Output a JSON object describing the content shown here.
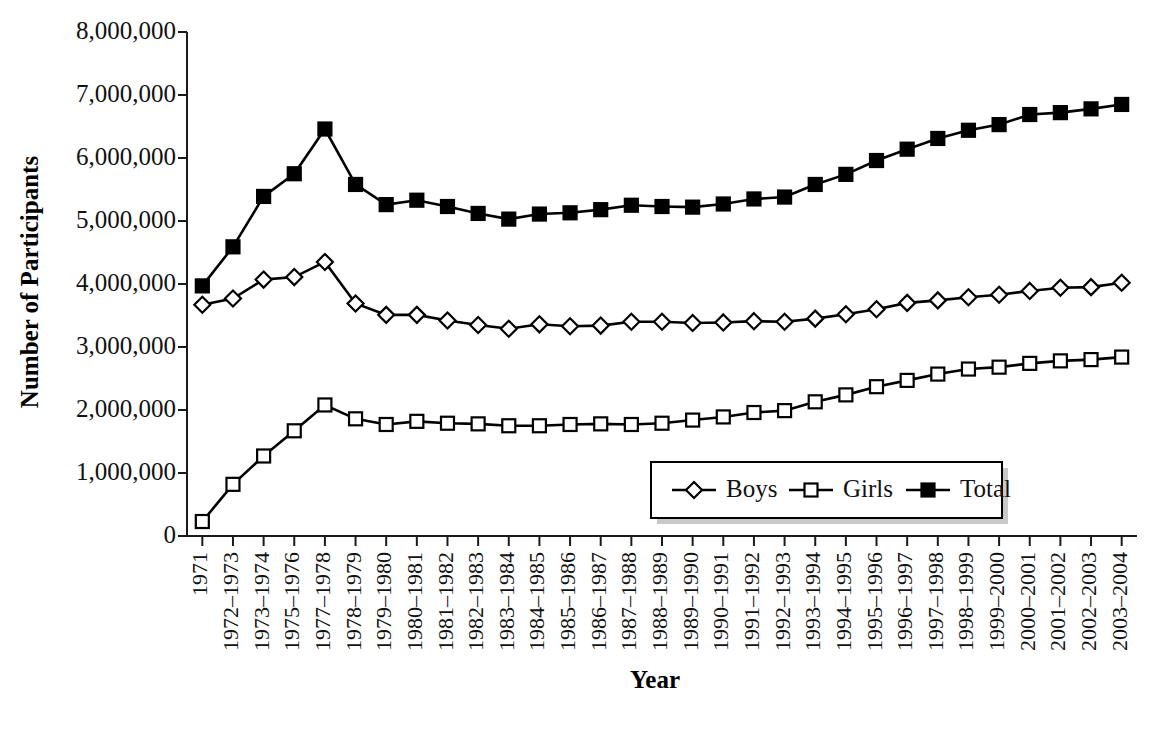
{
  "chart_data": {
    "type": "line",
    "title": "",
    "xlabel": "Year",
    "ylabel": "Number of Participants",
    "ylim": [
      0,
      8000000
    ],
    "ytick_labels": [
      "0",
      "1,000,000",
      "2,000,000",
      "3,000,000",
      "4,000,000",
      "5,000,000",
      "6,000,000",
      "7,000,000",
      "8,000,000"
    ],
    "ytick_values": [
      0,
      1000000,
      2000000,
      3000000,
      4000000,
      5000000,
      6000000,
      7000000,
      8000000
    ],
    "grid": false,
    "legend_position": "inside-lower-right",
    "categories": [
      "1971",
      "1972–1973",
      "1973–1974",
      "1975–1976",
      "1977–1978",
      "1978–1979",
      "1979–1980",
      "1980–1981",
      "1981–1982",
      "1982–1983",
      "1983–1984",
      "1984–1985",
      "1985–1986",
      "1986–1987",
      "1987–1988",
      "1988–1989",
      "1989–1990",
      "1990–1991",
      "1991–1992",
      "1992–1993",
      "1993–1994",
      "1994–1995",
      "1995–1996",
      "1996–1997",
      "1997–1998",
      "1998–1999",
      "1999–2000",
      "2000–2001",
      "2001–2002",
      "2002–2003",
      "2003–2004"
    ],
    "series": [
      {
        "name": "Boys",
        "marker": "open-diamond",
        "values": [
          3670000,
          3770000,
          4070000,
          4110000,
          4350000,
          3690000,
          3510000,
          3510000,
          3420000,
          3350000,
          3290000,
          3360000,
          3330000,
          3340000,
          3400000,
          3400000,
          3380000,
          3390000,
          3410000,
          3400000,
          3450000,
          3520000,
          3600000,
          3700000,
          3740000,
          3790000,
          3830000,
          3890000,
          3940000,
          3950000,
          4020000
        ]
      },
      {
        "name": "Girls",
        "marker": "open-square",
        "values": [
          230000,
          820000,
          1270000,
          1670000,
          2080000,
          1860000,
          1770000,
          1820000,
          1790000,
          1780000,
          1750000,
          1750000,
          1770000,
          1780000,
          1770000,
          1790000,
          1840000,
          1890000,
          1960000,
          1990000,
          2130000,
          2240000,
          2370000,
          2470000,
          2570000,
          2650000,
          2680000,
          2740000,
          2780000,
          2800000,
          2840000
        ]
      },
      {
        "name": "Total",
        "marker": "filled-square",
        "values": [
          3970000,
          4590000,
          5390000,
          5750000,
          6460000,
          5580000,
          5260000,
          5330000,
          5230000,
          5120000,
          5030000,
          5110000,
          5130000,
          5180000,
          5250000,
          5230000,
          5220000,
          5270000,
          5350000,
          5380000,
          5580000,
          5740000,
          5960000,
          6140000,
          6310000,
          6440000,
          6530000,
          6690000,
          6720000,
          6780000,
          6850000
        ]
      }
    ],
    "legend": [
      {
        "label": "Boys",
        "marker": "open-diamond"
      },
      {
        "label": "Girls",
        "marker": "open-square"
      },
      {
        "label": "Total",
        "marker": "filled-square"
      }
    ],
    "colors": {
      "line": "#000000",
      "marker_fill_open": "#ffffff",
      "marker_fill_solid": "#000000",
      "axis": "#1a1a1a",
      "background": "#ffffff"
    }
  }
}
